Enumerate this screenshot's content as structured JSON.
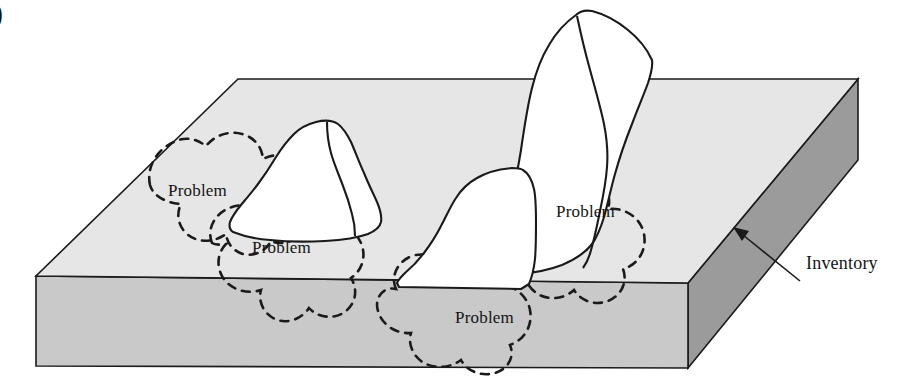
{
  "figure": {
    "marker": ")",
    "slab_label": "Inventory",
    "problem_labels": [
      {
        "text": "Problem",
        "x": 168,
        "y": 181
      },
      {
        "text": "Problem",
        "x": 252,
        "y": 238
      },
      {
        "text": "Problem",
        "x": 556,
        "y": 202
      },
      {
        "text": "Problem",
        "x": 455,
        "y": 308
      }
    ],
    "colors": {
      "top_face": "#e6e6e6",
      "front_face": "#c9c9c9",
      "right_face": "#9b9b9b",
      "rock_fill": "#ffffff",
      "outline": "#1a1a1a",
      "text": "#141414",
      "page_background": "#ffffff"
    },
    "geometry": {
      "slab_top_back_left_x": 238,
      "slab_top_back_left_y": 79,
      "slab_top_back_right_x": 858,
      "slab_top_back_right_y": 79,
      "slab_top_front_left_x": 36,
      "slab_top_front_left_y": 276,
      "slab_top_front_right_x": 688,
      "slab_top_front_right_y": 283,
      "slab_bottom_front_left_y": 366,
      "slab_bottom_front_right_y": 368,
      "slab_right_back_bottom_y": 160
    },
    "elements": {
      "rocks": [
        {
          "name": "rock-left",
          "peak_x": 316,
          "peak_y": 122
        },
        {
          "name": "rock-tall-center",
          "peak_x": 576,
          "peak_y": 15
        },
        {
          "name": "rock-front-center",
          "peak_x": 512,
          "peak_y": 168
        }
      ],
      "problem_blobs": 4,
      "pointer_arrow": {
        "from_x": 800,
        "from_y": 280,
        "to_x": 735,
        "to_y": 228
      }
    }
  }
}
